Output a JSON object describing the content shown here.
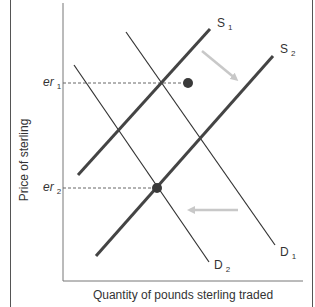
{
  "diagram": {
    "type": "supply-demand",
    "y_axis_label": "Price of sterling",
    "x_axis_label": "Quantity of pounds sterling traded",
    "price_levels": [
      {
        "name": "er",
        "sub": "1"
      },
      {
        "name": "er",
        "sub": "2"
      }
    ],
    "curves": [
      {
        "name": "S",
        "sub": "1",
        "kind": "supply",
        "weight": "thick"
      },
      {
        "name": "S",
        "sub": "2",
        "kind": "supply",
        "weight": "thick"
      },
      {
        "name": "D",
        "sub": "1",
        "kind": "demand",
        "weight": "thin"
      },
      {
        "name": "D",
        "sub": "2",
        "kind": "demand",
        "weight": "thin"
      }
    ],
    "equilibria": [
      {
        "curves": [
          "S1",
          "D1"
        ],
        "price": "er1"
      },
      {
        "curves": [
          "S2",
          "D2"
        ],
        "price": "er2"
      }
    ],
    "shift_arrows": [
      {
        "from": "S1",
        "to": "S2",
        "direction": "down-right"
      },
      {
        "from": "D1",
        "to": "D2",
        "direction": "left"
      }
    ],
    "colors": {
      "line": "#3a3a3a",
      "axis": "#666666",
      "arrow": "#c8c8c8",
      "point": "#3a3a3a"
    }
  }
}
